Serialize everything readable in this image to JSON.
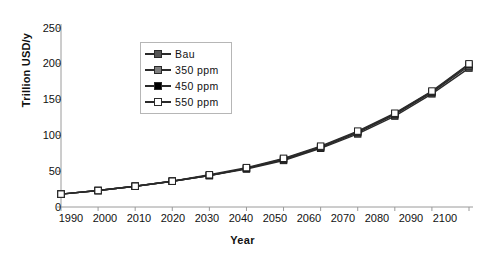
{
  "chart_data": {
    "type": "line",
    "title": "",
    "xlabel": "Year",
    "ylabel": "Trillion USD/y",
    "xlim": [
      1990,
      2100
    ],
    "ylim": [
      0,
      250
    ],
    "yticks": [
      0,
      50,
      100,
      150,
      200,
      250
    ],
    "grid": false,
    "legend_position": "upper-left-inside",
    "categories": [
      1990,
      2000,
      2010,
      2020,
      2030,
      2040,
      2050,
      2060,
      2070,
      2080,
      2090,
      2100
    ],
    "x": [
      1990,
      2000,
      2010,
      2020,
      2030,
      2040,
      2050,
      2060,
      2070,
      2080,
      2090,
      2100
    ],
    "series": [
      {
        "name": "Bau",
        "marker": "filled-dark-gray-square",
        "color": "#555555",
        "values": [
          18,
          23,
          29,
          36,
          44,
          53,
          65,
          82,
          102,
          127,
          158,
          194
        ]
      },
      {
        "name": "350 ppm",
        "marker": "filled-gray-square",
        "color": "#7f7f7f",
        "values": [
          18,
          23,
          29,
          36,
          44,
          54,
          66,
          83,
          104,
          129,
          160,
          197
        ]
      },
      {
        "name": "450 ppm",
        "marker": "filled-black-square",
        "color": "#000000",
        "values": [
          18,
          23,
          29,
          36,
          44,
          54,
          67,
          84,
          105,
          130,
          161,
          199
        ]
      },
      {
        "name": "550 ppm",
        "marker": "hollow-white-square",
        "color": "#ffffff",
        "values": [
          18,
          23,
          29,
          36,
          45,
          55,
          68,
          85,
          106,
          131,
          162,
          200
        ]
      }
    ]
  },
  "axes": {
    "y_title": "Trillion USD/y",
    "x_title": "Year",
    "y_tick_labels": [
      "250",
      "200",
      "150",
      "100",
      "50",
      "0"
    ],
    "x_tick_labels": [
      "1990",
      "2000",
      "2010",
      "2020",
      "2030",
      "2040",
      "2050",
      "2060",
      "2070",
      "2080",
      "2090",
      "2100"
    ]
  },
  "legend": {
    "entries": [
      {
        "label": "Bau"
      },
      {
        "label": "350 ppm"
      },
      {
        "label": "450 ppm"
      },
      {
        "label": "550 ppm"
      }
    ]
  },
  "caption": {
    "text": ""
  },
  "colors": {
    "axis": "#9a9a9a",
    "line": "#2a2a2a",
    "legend_border": "#b6b6b6",
    "text": "#111111"
  }
}
